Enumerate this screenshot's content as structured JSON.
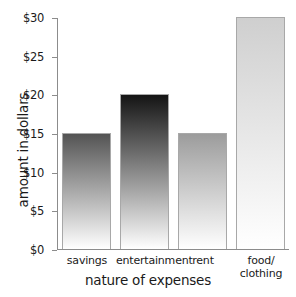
{
  "chart_data": {
    "type": "bar",
    "title": "",
    "xlabel": "nature of expenses",
    "ylabel": "amount in dollars",
    "categories": [
      "savings",
      "entertainment",
      "rent",
      "food/\nclothing"
    ],
    "values": [
      15,
      20,
      15,
      30
    ],
    "ylim": [
      0,
      30
    ],
    "yticks": [
      0,
      5,
      10,
      15,
      20,
      25,
      30
    ],
    "ytick_labels": [
      "$0",
      "$5",
      "$10",
      "$15",
      "$20",
      "$25",
      "$30"
    ],
    "grid": false,
    "legend": false,
    "bar_gradient_top_colors": [
      "#545454",
      "#141414",
      "#9c9c9c",
      "#cfcfcf"
    ],
    "bar_gradient_bottom_color": "#ffffff",
    "bar_border_color": "#a8a8a8",
    "axis_color": "#8c8c8c",
    "text_color": "#1a1a1a",
    "background": "#ffffff"
  },
  "axis": {
    "y_title": "amount in dollars",
    "x_title": "nature of expenses"
  },
  "ticks": {
    "y": [
      {
        "label": "$30",
        "value": 30
      },
      {
        "label": "$25",
        "value": 25
      },
      {
        "label": "$20",
        "value": 20
      },
      {
        "label": "$15",
        "value": 15
      },
      {
        "label": "$10",
        "value": 10
      },
      {
        "label": "$5",
        "value": 5
      },
      {
        "label": "$0",
        "value": 0
      }
    ]
  },
  "bars": [
    {
      "label": "savings",
      "label_line1": "savings",
      "label_line2": "",
      "value": 15
    },
    {
      "label": "entertainment",
      "label_line1": "entertainment",
      "label_line2": "",
      "value": 20
    },
    {
      "label": "rent",
      "label_line1": "rent",
      "label_line2": "",
      "value": 15
    },
    {
      "label": "food/clothing",
      "label_line1": "food/",
      "label_line2": "clothing",
      "value": 30
    }
  ]
}
